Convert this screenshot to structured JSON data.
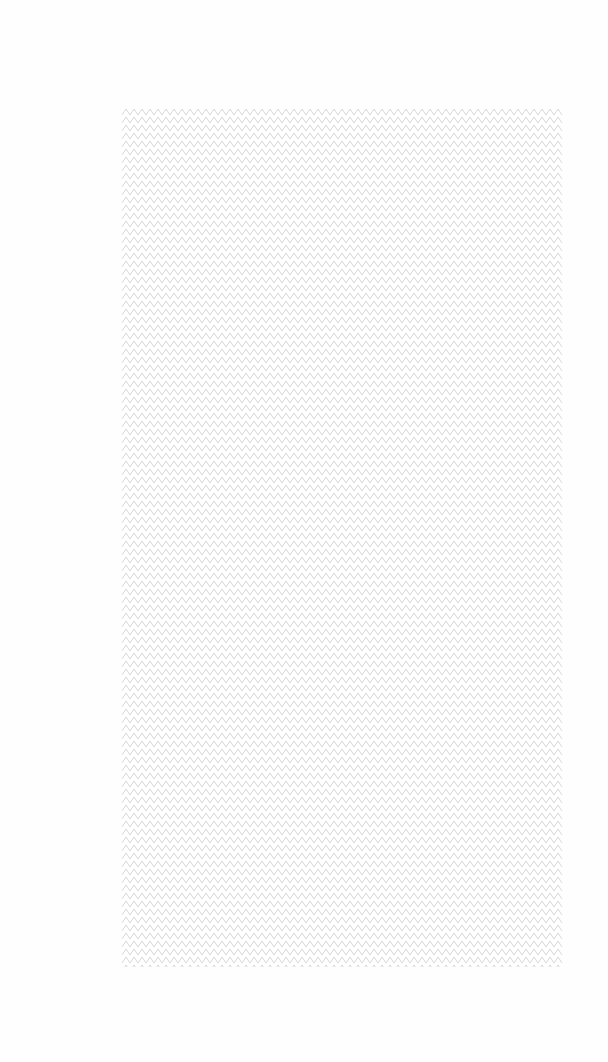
{
  "page": {
    "background_color": "#ffffff"
  },
  "pattern_panel": {
    "pattern": "zigzag-diamond-lattice",
    "line_color": "#d2d2d2",
    "fill_color": "#ffffff"
  }
}
